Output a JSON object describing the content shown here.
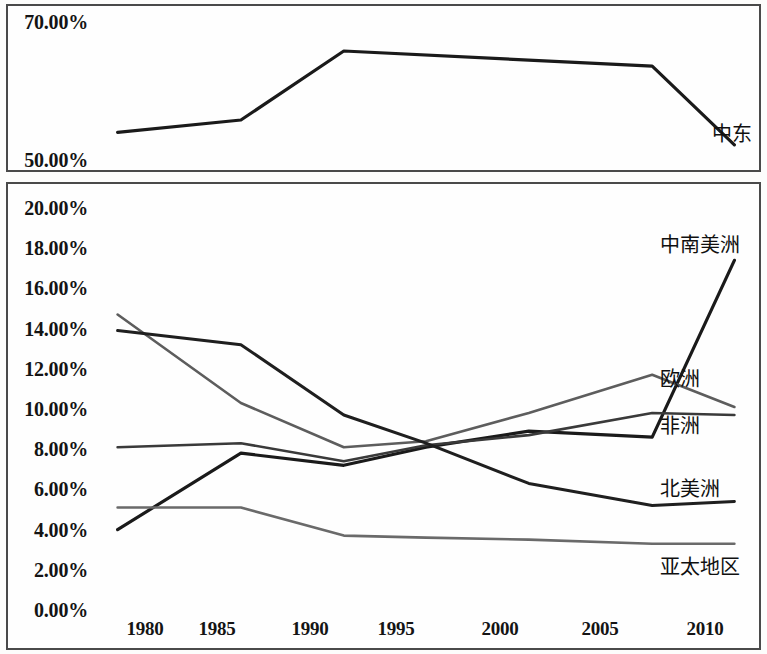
{
  "chart_data": [
    {
      "id": "top",
      "type": "line",
      "title": "",
      "xlabel": "",
      "ylabel": "",
      "ylim": [
        50.0,
        70.0
      ],
      "xlim": [
        1979,
        2011
      ],
      "grid": false,
      "unit": "%",
      "ytick_labels": [
        "70.00%",
        "50.00%"
      ],
      "ytick_values": [
        70.0,
        50.0
      ],
      "series": [
        {
          "name": "中东",
          "label": "中东",
          "color": "#1a1a1a",
          "width": 3.2,
          "x": [
            1980,
            1986,
            1991,
            2006,
            2010
          ],
          "values": [
            54.0,
            55.8,
            65.8,
            63.6,
            52.2
          ]
        }
      ]
    },
    {
      "id": "bottom",
      "type": "line",
      "title": "",
      "xlabel": "",
      "ylabel": "",
      "ylim": [
        0.0,
        20.0
      ],
      "xlim": [
        1979,
        2011
      ],
      "grid": false,
      "unit": "%",
      "ytick_labels": [
        "20.00%",
        "18.00%",
        "16.00%",
        "14.00%",
        "12.00%",
        "10.00%",
        "8.00%",
        "6.00%",
        "4.00%",
        "2.00%",
        "0.00%"
      ],
      "ytick_values": [
        20.0,
        18.0,
        16.0,
        14.0,
        12.0,
        10.0,
        8.0,
        6.0,
        4.0,
        2.0,
        0.0
      ],
      "xtick_labels": [
        "1980",
        "1985",
        "1990",
        "1995",
        "2000",
        "2005",
        "2010"
      ],
      "xtick_values": [
        1980,
        1985,
        1990,
        1995,
        2000,
        2005,
        2010
      ],
      "series": [
        {
          "name": "中南美洲",
          "label": "中南美洲",
          "color": "#1a1a1a",
          "width": 3.2,
          "x": [
            1980,
            1986,
            1991,
            1995,
            2000,
            2006,
            2010
          ],
          "values": [
            4.0,
            7.8,
            7.2,
            8.1,
            8.9,
            8.6,
            17.4
          ]
        },
        {
          "name": "欧洲",
          "label": "欧洲",
          "color": "#5d5d5d",
          "width": 2.6,
          "x": [
            1980,
            1986,
            1991,
            1995,
            2000,
            2006,
            2010
          ],
          "values": [
            14.7,
            10.3,
            8.1,
            8.4,
            9.8,
            11.7,
            10.1
          ]
        },
        {
          "name": "非洲",
          "label": "非洲",
          "color": "#3a3a3a",
          "width": 2.6,
          "x": [
            1980,
            1986,
            1991,
            1995,
            2000,
            2006,
            2010
          ],
          "values": [
            8.1,
            8.3,
            7.4,
            8.2,
            8.7,
            9.8,
            9.7
          ]
        },
        {
          "name": "北美洲",
          "label": "北美洲",
          "color": "#1f1f1f",
          "width": 3.0,
          "x": [
            1980,
            1986,
            1991,
            1995,
            2000,
            2006,
            2010
          ],
          "values": [
            13.9,
            13.2,
            9.7,
            8.3,
            6.3,
            5.2,
            5.4
          ]
        },
        {
          "name": "亚太地区",
          "label": "亚太地区",
          "color": "#6a6a6a",
          "width": 2.6,
          "x": [
            1980,
            1986,
            1991,
            1995,
            2000,
            2006,
            2010
          ],
          "values": [
            5.1,
            5.1,
            3.7,
            3.6,
            3.5,
            3.3,
            3.3
          ]
        }
      ]
    }
  ],
  "geometry": {
    "top_plot": {
      "left": 97,
      "right": 755,
      "top": 22,
      "bottom": 160
    },
    "bottom_plot": {
      "left": 97,
      "right": 755,
      "top": 208,
      "bottom": 610
    },
    "top_ylabel_x": 88,
    "bottom_ylabel_x": 88,
    "xlabel_y": 630,
    "x_pixel": {
      "1980": 145,
      "1985": 217,
      "1990": 310,
      "1995": 396,
      "2000": 500,
      "2005": 600,
      "2010": 705
    }
  },
  "labels": {
    "top_series_label_x": 712,
    "bottom_series_label_x": 660,
    "series_label_positions": {
      "中东": 132,
      "中南美洲": 243,
      "欧洲": 377,
      "非洲": 424,
      "北美洲": 487,
      "亚太地区": 565
    }
  }
}
